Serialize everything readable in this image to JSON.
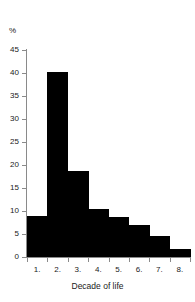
{
  "chart_data": {
    "type": "bar",
    "title": "",
    "subtitle": "",
    "xlabel": "Decade of life",
    "ylabel": "%",
    "categories": [
      "1.",
      "2.",
      "3.",
      "4.",
      "5.",
      "6.",
      "7.",
      "8."
    ],
    "values": [
      9.0,
      40.3,
      18.7,
      10.5,
      8.8,
      7.0,
      4.6,
      1.8
    ],
    "ylim": [
      0,
      45
    ],
    "ytick_labels": [
      "0",
      "5",
      "10",
      "15",
      "20",
      "25",
      "30",
      "35",
      "40",
      "45"
    ],
    "ytick_values": [
      0,
      5,
      10,
      15,
      20,
      25,
      30,
      35,
      40,
      45
    ],
    "xtick_labels": [
      "1.",
      "2.",
      "3.",
      "4.",
      "5.",
      "6.",
      "7.",
      "8."
    ],
    "grid": false,
    "legend": null,
    "legend_position": "none",
    "bar_color": "#000000",
    "axis_color": "#8a8a8a",
    "background": "#ffffff",
    "annotations": []
  }
}
